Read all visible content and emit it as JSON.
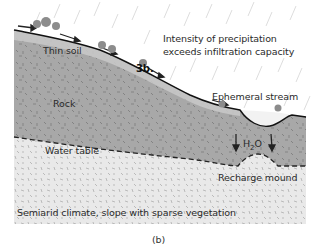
{
  "figure": {
    "caption": "(b)",
    "colors": {
      "rock": "#a9a9a9",
      "thin_soil": "#c4c4c4",
      "saturated_zone": "#e6e6e6",
      "rain": "#d6d6d6",
      "surface_line": "#111111",
      "tree": "#8a8a8a"
    }
  },
  "labels": {
    "thin_soil": "Thin soil",
    "rock": "Rock",
    "step": "3b.",
    "precipitation_line1": "Intensity of precipitation",
    "precipitation_line2": "exceeds infiltration capacity",
    "ephemeral_stream": "Ephemeral stream",
    "water_table": "Water table",
    "h2o_main": "H",
    "h2o_sub": "2",
    "h2o_end": "O",
    "recharge_mound": "Recharge mound",
    "climate": "Semiarid climate, slope with sparse vegetation"
  }
}
